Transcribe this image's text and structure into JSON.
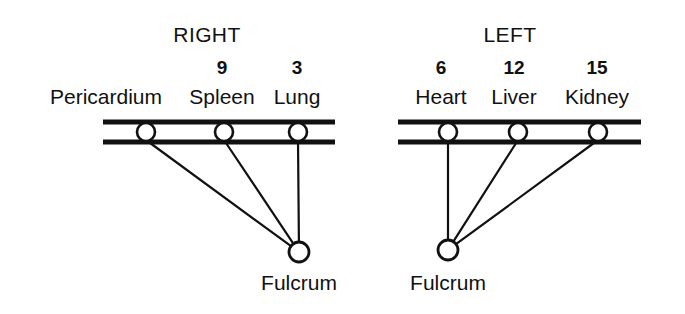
{
  "diagram": {
    "title_right": "RIGHT",
    "title_left": "LEFT",
    "fulcrum_label_a": "Fulcrum",
    "fulcrum_label_b": "Fulcrum",
    "right_side": {
      "heading": "RIGHT",
      "heading_x": 207,
      "heading_y": 24,
      "beam": {
        "x1": 103,
        "x2": 335,
        "y_top": 122,
        "y_bottom": 142
      },
      "fulcrum": {
        "x": 299,
        "y": 252,
        "r": 10,
        "label": "Fulcrum",
        "label_x": 299,
        "label_y": 272
      },
      "items": [
        {
          "label": "Pericardium",
          "weight": "",
          "pivot_x": 146,
          "label_x": 106,
          "weight_x": 106
        },
        {
          "label": "Spleen",
          "weight": "9",
          "pivot_x": 224,
          "label_x": 222,
          "weight_x": 222
        },
        {
          "label": "Lung",
          "weight": "3",
          "pivot_x": 298,
          "label_x": 297,
          "weight_x": 297
        }
      ]
    },
    "left_side": {
      "heading": "LEFT",
      "heading_x": 510,
      "heading_y": 24,
      "beam": {
        "x1": 398,
        "x2": 641,
        "y_top": 122,
        "y_bottom": 142
      },
      "fulcrum": {
        "x": 448,
        "y": 250,
        "r": 10,
        "label": "Fulcrum",
        "label_x": 448,
        "label_y": 272
      },
      "items": [
        {
          "label": "Heart",
          "weight": "6",
          "pivot_x": 448,
          "label_x": 441,
          "weight_x": 441
        },
        {
          "label": "Liver",
          "weight": "12",
          "pivot_x": 518,
          "label_x": 514,
          "weight_x": 514
        },
        {
          "label": "Kidney",
          "weight": "15",
          "pivot_x": 598,
          "label_x": 597,
          "weight_x": 597
        }
      ]
    },
    "geometry": {
      "label_row_y": 86,
      "weight_row_y": 58,
      "pivot_circle_y": 132,
      "pivot_circle_r": 9,
      "beam_stroke": 5,
      "line_stroke": 2.2
    },
    "colors": {
      "ink": "#111111",
      "background": "#ffffff"
    }
  }
}
